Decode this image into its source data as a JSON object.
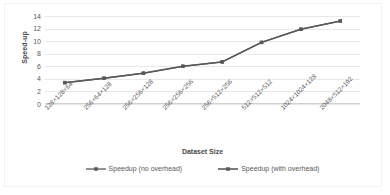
{
  "chart_data": {
    "type": "line",
    "title": "",
    "xlabel": "Dataset Size",
    "ylabel": "Speed-up",
    "categories": [
      "128×128×64",
      "256×64×128",
      "256×256×128",
      "256×256×256",
      "256×512×256",
      "512×512×512",
      "1024×1024×128",
      "2048×512×192"
    ],
    "series": [
      {
        "name": "Speedup (no overhead)",
        "color": "#595959",
        "marker": "square",
        "values": [
          3.4,
          4.1,
          4.9,
          6.0,
          6.7,
          9.8,
          11.9,
          13.2
        ]
      },
      {
        "name": "Speedup (with overhead)",
        "color": "#595959",
        "marker": "square",
        "values": [
          3.4,
          4.1,
          4.9,
          6.0,
          6.7,
          9.8,
          11.9,
          13.2
        ]
      }
    ],
    "ylim": [
      0,
      14
    ],
    "yticks": [
      "0",
      "2",
      "4",
      "6",
      "8",
      "10",
      "12",
      "14"
    ],
    "ytick_values": [
      0,
      2,
      4,
      6,
      8,
      10,
      12,
      14
    ],
    "grid": "horizontal",
    "legend_position": "bottom",
    "plot_background": "#ffffff",
    "gridline_color": "#e8e8e8",
    "text_color": "#595959"
  },
  "legend": {
    "items": [
      {
        "label": "Speedup (no overhead)"
      },
      {
        "label": "Speedup (with overhead)"
      }
    ]
  }
}
